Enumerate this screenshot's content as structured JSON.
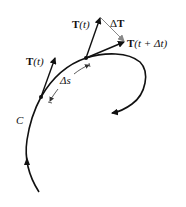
{
  "diagram": {
    "curve_label": "C",
    "labels": {
      "T_left_bold": "T",
      "T_left_arg": "(t)",
      "T_top_bold": "T",
      "T_top_arg": "(t)",
      "delta_T_sym": "Δ",
      "delta_T_bold": "T",
      "T_next_bold": "T",
      "T_next_arg": "(t + Δt)",
      "delta_s": "Δs"
    },
    "colors": {
      "curve": "#111111",
      "vectors": "#111111",
      "delta_T_vector": "#888888",
      "background": "#ffffff"
    }
  }
}
